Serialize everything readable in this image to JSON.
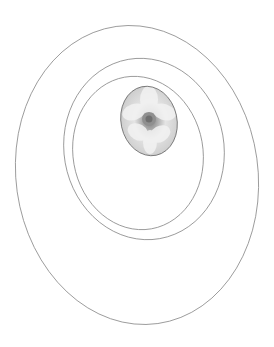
{
  "canvas": {
    "width": 274,
    "height": 347,
    "background": "#ffffff"
  },
  "stroke_color": "#8a8a8a",
  "ellipses": [
    {
      "name": "outer",
      "cx": 137,
      "cy": 175,
      "rx": 121,
      "ry": 150,
      "rotate": -8
    },
    {
      "name": "middle",
      "cx": 144,
      "cy": 149,
      "rx": 80,
      "ry": 91,
      "rotate": -10
    },
    {
      "name": "inner",
      "cx": 138,
      "cy": 153,
      "rx": 65,
      "ry": 77,
      "rotate": -10
    }
  ],
  "photo": {
    "subject": "white-flower",
    "cx": 149,
    "cy": 121,
    "rx": 28,
    "ry": 35,
    "rotate": -12,
    "tone": "grayscale"
  }
}
